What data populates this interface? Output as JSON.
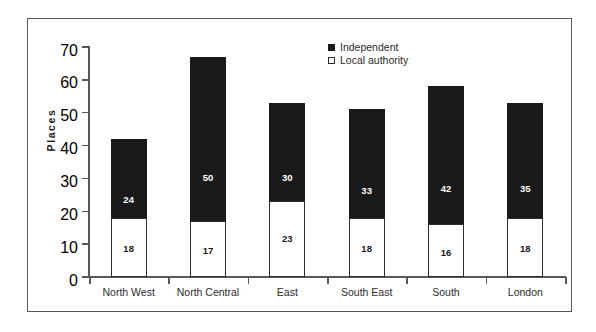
{
  "chart_data": {
    "type": "bar",
    "subtype": "stacked-vertical",
    "title": "",
    "xlabel": "",
    "ylabel": "Places",
    "ylim": [
      0,
      70
    ],
    "y_ticks": [
      0,
      10,
      20,
      30,
      40,
      50,
      60,
      70
    ],
    "grid": false,
    "legend_position": "top-center",
    "categories": [
      "North West",
      "North Central",
      "East",
      "South East",
      "South",
      "London"
    ],
    "series": [
      {
        "name": "Local authority",
        "color": "#ffffff",
        "border_color": "#2d2d2d",
        "values": [
          18,
          17,
          23,
          18,
          16,
          18
        ]
      },
      {
        "name": "Independent",
        "color": "#1a1a1a",
        "border_color": "#1a1a1a",
        "values": [
          24,
          50,
          30,
          33,
          42,
          35
        ]
      }
    ],
    "stack_order": [
      "Local authority",
      "Independent"
    ],
    "totals": [
      42,
      67,
      53,
      51,
      58,
      53
    ],
    "data_labels": {
      "Local authority": [
        "18",
        "17",
        "23",
        "18",
        "16",
        "18"
      ],
      "Independent": [
        "24",
        "50",
        "30",
        "33",
        "42",
        "35"
      ]
    }
  },
  "legend": {
    "items": [
      {
        "label": "Independent",
        "swatch": "filled-square-icon"
      },
      {
        "label": "Local authority",
        "swatch": "outline-square-icon"
      }
    ]
  },
  "axis": {
    "y_title": "Places",
    "y_tick_labels": [
      "70",
      "60",
      "50",
      "40",
      "30",
      "20",
      "10",
      "0"
    ],
    "x_tick_labels": [
      "North West",
      "North Central",
      "East",
      "South East",
      "South",
      "London"
    ]
  },
  "colors": {
    "independent": "#1a1a1a",
    "local_authority": "#ffffff",
    "axis": "#58585a",
    "frame": "#58585a",
    "background": "#ffffff",
    "text": "#2b2b2b"
  }
}
